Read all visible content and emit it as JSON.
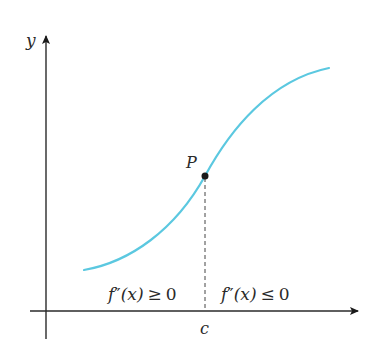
{
  "diagram": {
    "axes": {
      "y_label": "y",
      "x_tick_label": "c"
    },
    "point": {
      "label": "P"
    },
    "regions": {
      "left": {
        "func": "f",
        "primes": "″",
        "arg": "(x)",
        "relation": "≥",
        "value": "0"
      },
      "right": {
        "func": "f",
        "primes": "″",
        "arg": "(x)",
        "relation": "≤",
        "value": "0"
      }
    },
    "colors": {
      "curve": "#5bc8e0",
      "axis": "#2a2a2a",
      "point": "#1a1a1a",
      "dashed": "#444444"
    }
  }
}
